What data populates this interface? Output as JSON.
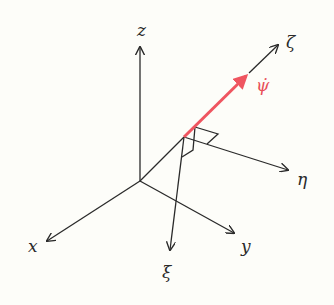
{
  "diagram": {
    "title": "",
    "background": "#fdfdf9",
    "colors": {
      "axis": "#2a2a2a",
      "highlight": "#ef5560"
    },
    "frame_fixed": {
      "origin": [
        140,
        181
      ],
      "axes": [
        {
          "name": "z",
          "label": "z",
          "tip": [
            140,
            47
          ],
          "label_pos": [
            137,
            36
          ]
        },
        {
          "name": "x",
          "label": "x",
          "tip": [
            47,
            241
          ],
          "label_pos": [
            28,
            252
          ]
        },
        {
          "name": "y",
          "label": "y",
          "tip": [
            234,
            233
          ],
          "label_pos": [
            241,
            252
          ]
        }
      ]
    },
    "frame_body": {
      "origin": [
        184,
        137
      ],
      "axes": [
        {
          "name": "zeta",
          "label": "ζ",
          "tip": [
            278,
            45
          ],
          "label_pos": [
            286,
            48
          ]
        },
        {
          "name": "eta",
          "label": "η",
          "tip": [
            288,
            170
          ],
          "label_pos": [
            297,
            185
          ]
        },
        {
          "name": "xi",
          "label": "ξ",
          "tip": [
            170,
            250
          ],
          "label_pos": [
            162,
            278
          ]
        }
      ]
    },
    "highlight_vector": {
      "name": "psi-dot",
      "label": "ψ̇",
      "from": [
        184,
        137
      ],
      "to": [
        249,
        73
      ],
      "label_pos": [
        256,
        91
      ]
    },
    "connector": {
      "from": [
        140,
        181
      ],
      "to": [
        184,
        137
      ]
    }
  }
}
